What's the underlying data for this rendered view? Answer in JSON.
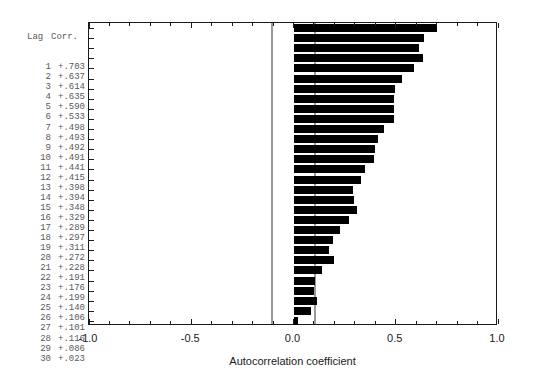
{
  "table": {
    "header_lag": "Lag",
    "header_corr": "Corr.",
    "rows": [
      {
        "lag": "1",
        "corr": "+.703"
      },
      {
        "lag": "2",
        "corr": "+.637"
      },
      {
        "lag": "3",
        "corr": "+.614"
      },
      {
        "lag": "4",
        "corr": "+.635"
      },
      {
        "lag": "5",
        "corr": "+.590"
      },
      {
        "lag": "6",
        "corr": "+.533"
      },
      {
        "lag": "7",
        "corr": "+.498"
      },
      {
        "lag": "8",
        "corr": "+.493"
      },
      {
        "lag": "9",
        "corr": "+.492"
      },
      {
        "lag": "10",
        "corr": "+.491"
      },
      {
        "lag": "11",
        "corr": "+.441"
      },
      {
        "lag": "12",
        "corr": "+.415"
      },
      {
        "lag": "13",
        "corr": "+.398"
      },
      {
        "lag": "14",
        "corr": "+.394"
      },
      {
        "lag": "15",
        "corr": "+.348"
      },
      {
        "lag": "16",
        "corr": "+.329"
      },
      {
        "lag": "17",
        "corr": "+.289"
      },
      {
        "lag": "18",
        "corr": "+.297"
      },
      {
        "lag": "19",
        "corr": "+.311"
      },
      {
        "lag": "20",
        "corr": "+.272"
      },
      {
        "lag": "21",
        "corr": "+.228"
      },
      {
        "lag": "22",
        "corr": "+.191"
      },
      {
        "lag": "23",
        "corr": "+.176"
      },
      {
        "lag": "24",
        "corr": "+.199"
      },
      {
        "lag": "25",
        "corr": "+.140"
      },
      {
        "lag": "26",
        "corr": "+.106"
      },
      {
        "lag": "27",
        "corr": "+.101"
      },
      {
        "lag": "28",
        "corr": "+.116"
      },
      {
        "lag": "29",
        "corr": "+.086"
      },
      {
        "lag": "30",
        "corr": "+.023"
      }
    ]
  },
  "colors": {
    "bar": "#000000",
    "confidence_line": "#9a9a9a",
    "frame": "#1a1a1a",
    "table_text": "#5a5a5a"
  },
  "chart_data": {
    "type": "bar",
    "orientation": "horizontal",
    "title": "",
    "xlabel": "Autocorrelation coefficient",
    "ylabel": "",
    "xlim": [
      -1.0,
      1.0
    ],
    "xticks": [
      -1.0,
      -0.5,
      0.0,
      0.5,
      1.0
    ],
    "xticklabels": [
      "-1.0",
      "-0.5",
      "0.0",
      "0.5",
      "1.0"
    ],
    "grid": false,
    "legend": null,
    "categories": [
      1,
      2,
      3,
      4,
      5,
      6,
      7,
      8,
      9,
      10,
      11,
      12,
      13,
      14,
      15,
      16,
      17,
      18,
      19,
      20,
      21,
      22,
      23,
      24,
      25,
      26,
      27,
      28,
      29,
      30
    ],
    "values": [
      0.703,
      0.637,
      0.614,
      0.635,
      0.59,
      0.533,
      0.498,
      0.493,
      0.492,
      0.491,
      0.441,
      0.415,
      0.398,
      0.394,
      0.348,
      0.329,
      0.289,
      0.297,
      0.311,
      0.272,
      0.228,
      0.191,
      0.176,
      0.199,
      0.14,
      0.106,
      0.101,
      0.116,
      0.086,
      0.023
    ],
    "confidence_bounds": [
      -0.105,
      0.105
    ]
  }
}
